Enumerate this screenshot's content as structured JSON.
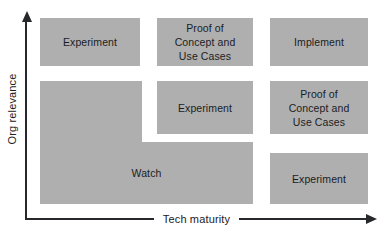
{
  "figure": {
    "type": "matrix-diagram",
    "fill_color": "#afafaf",
    "text_color": "#1b1d1f",
    "axis_color": "#26282b",
    "background": "#ffffff"
  },
  "axes": {
    "x": {
      "label": "Tech maturity",
      "direction": "increasing-right",
      "arrow": "right-arrow-icon"
    },
    "y": {
      "label": "Org relevance",
      "direction": "increasing-up",
      "arrow": "up-arrow-icon"
    }
  },
  "chart_data": {
    "type": "table",
    "title": "",
    "xlabel": "Tech maturity",
    "ylabel": "Org relevance",
    "grid": false,
    "legend": "none",
    "columns": [
      "low maturity",
      "medium maturity",
      "high maturity"
    ],
    "rows": [
      "high relevance",
      "medium relevance",
      "low relevance"
    ],
    "cells": [
      {
        "row": 0,
        "col": 0,
        "label": "Experiment",
        "span_rows": 1,
        "span_cols": 1
      },
      {
        "row": 0,
        "col": 1,
        "label": "Proof of\nConcept and\nUse Cases",
        "span_rows": 1,
        "span_cols": 1
      },
      {
        "row": 0,
        "col": 2,
        "label": "Implement",
        "span_rows": 1,
        "span_cols": 1
      },
      {
        "row": 1,
        "col": 1,
        "label": "Experiment",
        "span_rows": 1,
        "span_cols": 1
      },
      {
        "row": 1,
        "col": 2,
        "label": "Proof of\nConcept and\nUse Cases",
        "span_rows": 1,
        "span_cols": 1
      },
      {
        "row": 1,
        "col": 0,
        "label": "Watch",
        "span_rows": 2,
        "span_cols": 2,
        "shape": "L-shaped"
      },
      {
        "row": 2,
        "col": 2,
        "label": "Experiment",
        "span_rows": 1,
        "span_cols": 1
      }
    ]
  },
  "cells": {
    "r1c1": "Experiment",
    "r1c2": "Proof of\nConcept and\nUse Cases",
    "r1c3": "Implement",
    "r2c2": "Experiment",
    "r2c3": "Proof of\nConcept and\nUse Cases",
    "watch": "Watch",
    "r3c3": "Experiment"
  }
}
